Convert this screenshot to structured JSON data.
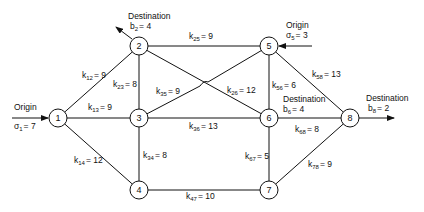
{
  "diagram": {
    "type": "network-flow",
    "nodes": [
      {
        "id": "1",
        "label": "1",
        "x": 58,
        "y": 118
      },
      {
        "id": "2",
        "label": "2",
        "x": 139,
        "y": 46
      },
      {
        "id": "3",
        "label": "3",
        "x": 139,
        "y": 118
      },
      {
        "id": "4",
        "label": "4",
        "x": 139,
        "y": 190
      },
      {
        "id": "5",
        "label": "5",
        "x": 269,
        "y": 46
      },
      {
        "id": "6",
        "label": "6",
        "x": 269,
        "y": 118
      },
      {
        "id": "7",
        "label": "7",
        "x": 269,
        "y": 190
      },
      {
        "id": "8",
        "label": "8",
        "x": 350,
        "y": 118
      }
    ],
    "edges": [
      {
        "from": "1",
        "to": "2",
        "k": "k",
        "sub": "12",
        "value": "= 9"
      },
      {
        "from": "1",
        "to": "3",
        "k": "k",
        "sub": "13",
        "value": "= 9"
      },
      {
        "from": "1",
        "to": "4",
        "k": "k",
        "sub": "14",
        "value": "= 12"
      },
      {
        "from": "2",
        "to": "3",
        "k": "k",
        "sub": "23",
        "value": "= 8"
      },
      {
        "from": "2",
        "to": "5",
        "k": "k",
        "sub": "25",
        "value": "= 9"
      },
      {
        "from": "2",
        "to": "6",
        "k": "k",
        "sub": "26",
        "value": "= 12"
      },
      {
        "from": "3",
        "to": "5",
        "k": "k",
        "sub": "35",
        "value": "= 9"
      },
      {
        "from": "3",
        "to": "6",
        "k": "k",
        "sub": "36",
        "value": "= 13"
      },
      {
        "from": "3",
        "to": "4",
        "k": "k",
        "sub": "34",
        "value": "= 8"
      },
      {
        "from": "4",
        "to": "7",
        "k": "k",
        "sub": "47",
        "value": "= 10"
      },
      {
        "from": "5",
        "to": "6",
        "k": "k",
        "sub": "56",
        "value": "= 6"
      },
      {
        "from": "5",
        "to": "8",
        "k": "k",
        "sub": "58",
        "value": "= 13"
      },
      {
        "from": "6",
        "to": "7",
        "k": "k",
        "sub": "67",
        "value": "= 5"
      },
      {
        "from": "6",
        "to": "8",
        "k": "k",
        "sub": "68",
        "value": "= 8"
      },
      {
        "from": "7",
        "to": "8",
        "k": "k",
        "sub": "78",
        "value": "= 9"
      }
    ],
    "annotations": {
      "origin1": {
        "title": "Origin",
        "sym": "σ",
        "sub": "1",
        "value": "= 7"
      },
      "origin5": {
        "title": "Origin",
        "sym": "σ",
        "sub": "5",
        "value": "= 3"
      },
      "dest2": {
        "title": "Destination",
        "sym": "b",
        "sub": "2",
        "value": "= 4"
      },
      "dest6": {
        "title": "Destination",
        "sym": "b",
        "sub": "6",
        "value": "= 4"
      },
      "dest8": {
        "title": "Destination",
        "sym": "b",
        "sub": "8",
        "value": "= 2"
      }
    }
  }
}
